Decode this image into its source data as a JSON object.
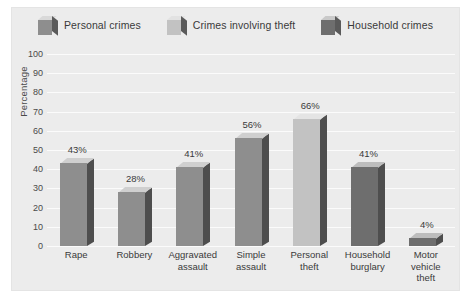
{
  "chart_data": {
    "type": "bar",
    "title": "",
    "xlabel": "",
    "ylabel": "Percentage",
    "ylim": [
      0,
      100
    ],
    "ytick_step": 10,
    "yticks": [
      "100",
      "90",
      "80",
      "70",
      "60",
      "50",
      "40",
      "30",
      "20",
      "10",
      "0"
    ],
    "grid": true,
    "legend_position": "top-center",
    "categories": [
      "Rape",
      "Robbery",
      "Aggravated assault",
      "Simple assault",
      "Personal theft",
      "Household burglary",
      "Motor vehicle theft"
    ],
    "values": [
      43,
      28,
      41,
      56,
      66,
      41,
      4
    ],
    "value_labels": [
      "43%",
      "28%",
      "41%",
      "56%",
      "66%",
      "41%",
      "4%"
    ],
    "series": [
      {
        "name": "Personal crimes",
        "color": "#8e8e8e"
      },
      {
        "name": "Crimes involving theft",
        "color": "#c2c2c2"
      },
      {
        "name": "Household crimes",
        "color": "#6e6e6e"
      }
    ],
    "bar_series_index": [
      0,
      0,
      0,
      0,
      1,
      2,
      2
    ]
  },
  "legend": {
    "items": [
      {
        "label": "Personal crimes",
        "color": "#8e8e8e"
      },
      {
        "label": "Crimes involving theft",
        "color": "#c2c2c2"
      },
      {
        "label": "Household crimes",
        "color": "#6e6e6e"
      }
    ]
  },
  "axis": {
    "y_title": "Percentage"
  },
  "x_labels": [
    [
      "Rape"
    ],
    [
      "Robbery"
    ],
    [
      "Aggravated",
      "assault"
    ],
    [
      "Simple",
      "assault"
    ],
    [
      "Personal",
      "theft"
    ],
    [
      "Household",
      "burglary"
    ],
    [
      "Motor",
      "vehicle",
      "theft"
    ]
  ],
  "colors": {
    "panel_bg": "#ececec",
    "plot_bg": "#ececec",
    "gridline": "#fbfbfb",
    "page_bg": "#ffffff",
    "text": "#3a3a3a"
  }
}
